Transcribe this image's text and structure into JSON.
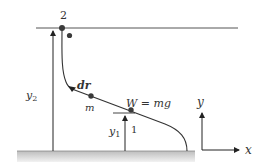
{
  "diagram": {
    "points": {
      "start": {
        "label": "1"
      },
      "end": {
        "label": "2"
      }
    },
    "labels": {
      "point_2": "2",
      "point_1": "1",
      "displacement": "dr",
      "mass": "m",
      "weight": "W = mg",
      "height_2": "y",
      "height_2_sub": "2",
      "height_1": "y",
      "height_1_sub": "1",
      "axis_y": "y",
      "axis_x": "x"
    },
    "colors": {
      "line": "#444444",
      "dot": "#3a3a3a",
      "ground": "#c8c8c8",
      "text": "#333333"
    }
  }
}
